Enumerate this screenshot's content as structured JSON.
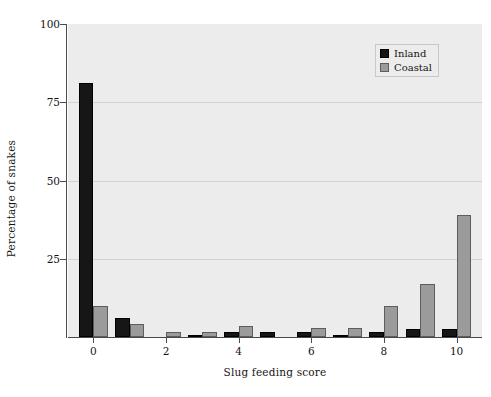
{
  "chart_data": {
    "type": "bar",
    "title": "",
    "xlabel": "Slug feeding score",
    "ylabel": "Percentage of snakes",
    "categories": [
      "0",
      "1",
      "2",
      "3",
      "4",
      "5",
      "6",
      "7",
      "8",
      "9",
      "10"
    ],
    "xtick_labels": [
      "0",
      "2",
      "4",
      "6",
      "8",
      "10"
    ],
    "xtick_values": [
      0,
      2,
      4,
      6,
      8,
      10
    ],
    "ytick_labels": [
      "25",
      "50",
      "75",
      "100"
    ],
    "ytick_values": [
      25,
      50,
      75,
      100
    ],
    "ylim": [
      0,
      100
    ],
    "xlim": [
      -0.7,
      10.7
    ],
    "grid": "horizontal",
    "legend_position": "top-right",
    "series": [
      {
        "name": "Inland",
        "color": "#161616",
        "values": [
          81,
          6,
          0,
          0.5,
          1.5,
          1.5,
          1.5,
          0.8,
          1.5,
          2.5,
          2.5
        ]
      },
      {
        "name": "Coastal",
        "color": "#9b9b9b",
        "values": [
          10,
          4,
          1.5,
          1.5,
          3.5,
          0,
          3,
          3,
          10,
          17,
          39
        ]
      }
    ]
  },
  "legend": {
    "entries": [
      {
        "label": "Inland"
      },
      {
        "label": "Coastal"
      }
    ]
  },
  "colors": {
    "inland": "#161616",
    "coastal": "#9b9b9b",
    "plot_background": "#ececec",
    "gridline": "#d2d2d2",
    "axis": "#4a4a4a",
    "text": "#141414"
  }
}
